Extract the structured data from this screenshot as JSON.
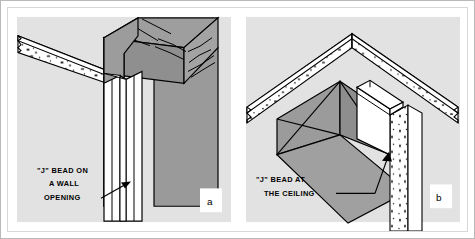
{
  "figure": {
    "background_color": "#ffffff",
    "frame_color": "#b9b9b9",
    "panel_background_color": "#e2e2e2",
    "fill_gray": "#999999",
    "fill_gray_dark": "#8a8a8a",
    "fill_white": "#ffffff",
    "line_color": "#000000"
  },
  "panels": [
    {
      "key": "a",
      "label": "a",
      "caption_lines": [
        "\"J\" BEAD ON",
        "A WALL",
        "OPENING"
      ],
      "caption_text": "\"J\" BEAD ON A WALL OPENING",
      "subject": "j-bead-on-wall-opening",
      "annotation": "leader line with arrow pointing right to the J bead on the vertical drywall edge of a framed wall opening",
      "elements": [
        "wall drywall band with gypsum speckle texture",
        "wood header / lintel with grain lines",
        "vertical stud post",
        "white J bead channel on drywall edge"
      ]
    },
    {
      "key": "b",
      "label": "b",
      "caption_lines": [
        "\"J\" BEAD AT",
        "THE CEILING"
      ],
      "caption_text": "\"J\" BEAD AT THE CEILING",
      "subject": "j-bead-at-ceiling",
      "annotation": "leader line with arrow pointing up-right to the J bead where the soffit meets the ceiling wall",
      "elements": [
        "ceiling drywall band with gypsum speckle texture",
        "gray soffit / beam box",
        "wall drywall with gypsum speckle texture",
        "white J bead channel at ceiling"
      ]
    }
  ]
}
